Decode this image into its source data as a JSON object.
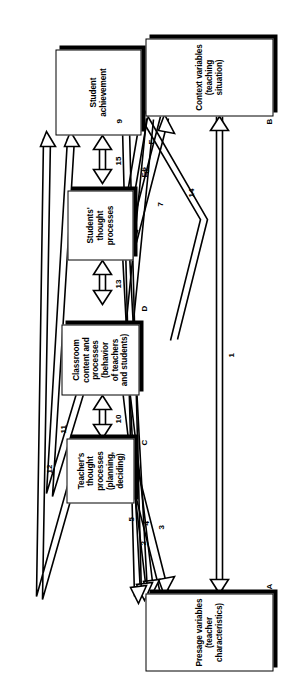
{
  "figure": {
    "orientation": "rotated-90-ccw",
    "line_color": "#000000",
    "fill_color": "#ffffff"
  },
  "nodes": [
    {
      "id": "A",
      "tag": "A",
      "label": "Presage variables\n(teacher characteristics)"
    },
    {
      "id": "B",
      "tag": "B",
      "label": "Context variables\n(teaching situation)"
    },
    {
      "id": "C",
      "tag": "C",
      "label": "Teacher's\nthought\nprocesses\n(planning,\ndeciding)"
    },
    {
      "id": "D",
      "tag": "D",
      "label": "Classroom\ncontent and\nprocesses\n(behavior\nof teachers\nand students)"
    },
    {
      "id": "E",
      "tag": "E",
      "label": "Students'\nthought\nprocesses"
    },
    {
      "id": "F",
      "tag": "F",
      "label": "Student\nachievement"
    }
  ],
  "edges": [
    {
      "id": "1",
      "num": "1",
      "from": "A",
      "to": "B",
      "style": "double-headed"
    },
    {
      "id": "2",
      "num": "2",
      "from": "A",
      "to": "C",
      "style": "double-headed"
    },
    {
      "id": "3",
      "num": "3",
      "from": "D",
      "to": "A",
      "style": "single-headed"
    },
    {
      "id": "4",
      "num": "4",
      "from": "E",
      "to": "A",
      "style": "single-headed"
    },
    {
      "id": "5",
      "num": "5",
      "from": "F",
      "to": "A",
      "style": "single-headed"
    },
    {
      "id": "6",
      "num": "6",
      "from": "B",
      "to": "C",
      "style": "double-headed"
    },
    {
      "id": "7",
      "num": "7",
      "from": "B",
      "to": "D",
      "style": "single-headed"
    },
    {
      "id": "8",
      "num": "8",
      "from": "B",
      "to": "E",
      "style": "single-headed"
    },
    {
      "id": "9",
      "num": "9",
      "from": "B",
      "to": "F",
      "style": "single-headed"
    },
    {
      "id": "10",
      "num": "10",
      "from": "C",
      "to": "D",
      "style": "single-headed"
    },
    {
      "id": "11",
      "num": "11",
      "from": "D",
      "to": "F",
      "style": "single-headed"
    },
    {
      "id": "12",
      "num": "12",
      "from": "C",
      "to": "F",
      "style": "single-headed"
    },
    {
      "id": "13",
      "num": "13",
      "from": "D",
      "to": "E",
      "style": "single-headed"
    },
    {
      "id": "14",
      "num": "14",
      "from": "D",
      "to": "F",
      "style": "single-headed"
    },
    {
      "id": "15",
      "num": "15",
      "from": "E",
      "to": "F",
      "style": "single-headed"
    }
  ]
}
